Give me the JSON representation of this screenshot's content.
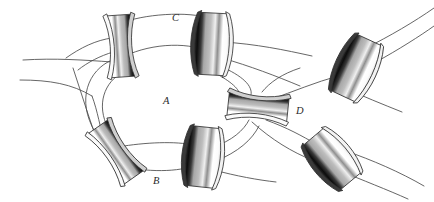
{
  "figure": {
    "kind": "line-drawing",
    "background_color": "#ffffff",
    "stroke_color": "#4a4a4a",
    "labels": [
      {
        "id": "A",
        "text": "A",
        "x": 163,
        "y": 96,
        "name": "region-label-a"
      },
      {
        "id": "B",
        "text": "B",
        "x": 153,
        "y": 176,
        "name": "region-label-b"
      },
      {
        "id": "C",
        "text": "C",
        "x": 172,
        "y": 13,
        "name": "region-label-c"
      },
      {
        "id": "D",
        "text": "D",
        "x": 296,
        "y": 106,
        "name": "region-label-d"
      }
    ],
    "beads": [
      {
        "id": "bead-top-left",
        "cx": 121,
        "cy": 46,
        "angle": -4,
        "w": 25,
        "h": 62,
        "bow": 9,
        "dark_side": "right"
      },
      {
        "id": "bead-top-right",
        "cx": 212,
        "cy": 44,
        "angle": 3,
        "w": 25,
        "h": 62,
        "bow": -9,
        "dark_side": "left"
      },
      {
        "id": "bead-bottom-left",
        "cx": 116,
        "cy": 152,
        "angle": -32,
        "w": 25,
        "h": 62,
        "bow": 9,
        "dark_side": "right"
      },
      {
        "id": "bead-bottom-middle",
        "cx": 203,
        "cy": 158,
        "angle": 6,
        "w": 25,
        "h": 60,
        "bow": -9,
        "dark_side": "left"
      },
      {
        "id": "bead-center-d",
        "cx": 258,
        "cy": 107,
        "angle": -84,
        "w": 25,
        "h": 60,
        "bow": 9,
        "dark_side": "right"
      },
      {
        "id": "bead-far-right-top",
        "cx": 357,
        "cy": 68,
        "angle": 25,
        "w": 25,
        "h": 62,
        "bow": 10,
        "dark_side": "left"
      },
      {
        "id": "bead-far-right-bot",
        "cx": 333,
        "cy": 160,
        "angle": -38,
        "w": 25,
        "h": 58,
        "bow": -9,
        "dark_side": "left"
      }
    ],
    "colors": {
      "bead_outline": "#2f2f2f",
      "bead_highlight": "#f4f4f4",
      "bead_midtone": "#b4b4b4",
      "bead_shadow": "#111111",
      "strand": "#4a4a4a",
      "label": "#2a2a2a"
    },
    "counts": {
      "beads": 7,
      "labels": 4
    }
  }
}
